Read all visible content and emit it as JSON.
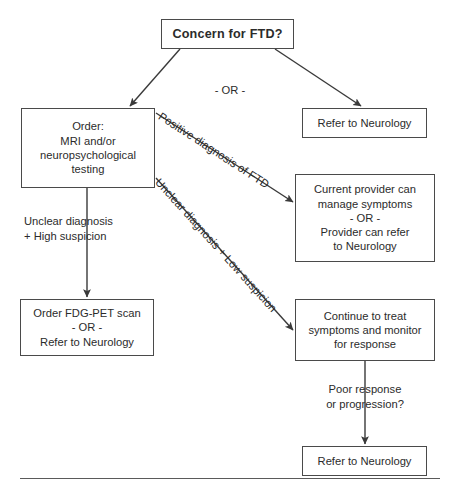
{
  "diagram": {
    "title_node": {
      "label": "Concern for FTD?"
    },
    "or_connector": {
      "label": "- OR -"
    },
    "nodes": {
      "order_workup": {
        "label": "Order:\nMRI and/or\nneuropsychological\ntesting"
      },
      "refer_neurology_top": {
        "label": "Refer to Neurology"
      },
      "current_provider": {
        "label": "Current provider can\nmanage symptoms\n- OR -\nProvider can refer\nto Neurology"
      },
      "order_fdg_pet": {
        "label": "Order FDG-PET scan\n- OR -\nRefer to Neurology"
      },
      "continue_treat": {
        "label": "Continue to treat\nsymptoms and monitor\nfor response"
      },
      "refer_neurology_bottom": {
        "label": "Refer to Neurology"
      }
    },
    "edge_labels": {
      "positive_diagnosis": "Positive diagnosis of FTD",
      "unclear_low_suspicion": "Unclear diagnosis + Low suspicion",
      "unclear_high_suspicion": "Unclear diagnosis\n+ High suspicion",
      "poor_response": "Poor response\nor progression?"
    },
    "colors": {
      "stroke": "#3a3a3a",
      "box_border": "#4a4a4a",
      "text": "#2b2b2b",
      "background": "#ffffff",
      "rule": "#5a5a5a"
    }
  }
}
